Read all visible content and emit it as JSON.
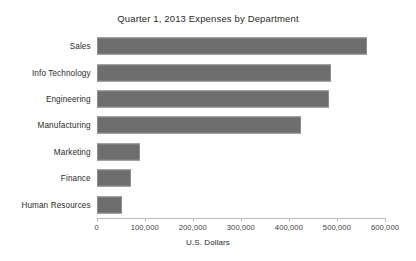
{
  "chart_data": {
    "type": "bar",
    "orientation": "horizontal",
    "title": "Quarter 1, 2013 Expenses by Department",
    "xlabel": "U.S. Dollars",
    "ylabel": "",
    "categories": [
      "Sales",
      "Info Technology",
      "Engineering",
      "Manufacturing",
      "Marketing",
      "Finance",
      "Human Resources"
    ],
    "values": [
      562000,
      488000,
      484000,
      425000,
      90000,
      71000,
      53000
    ],
    "series": [
      {
        "name": "Q1 2013 Expenses",
        "values": [
          562000,
          488000,
          484000,
          425000,
          90000,
          71000,
          53000
        ]
      }
    ],
    "xlim": [
      0,
      600000
    ],
    "xticks": [
      0,
      100000,
      200000,
      300000,
      400000,
      500000,
      600000
    ],
    "xtick_labels": [
      "0",
      "100,000",
      "200,000",
      "300,000",
      "400,000",
      "500,000",
      "600,000"
    ],
    "grid": false,
    "legend": false,
    "bar_color": "#6e6e6e",
    "bar_edge_color": "#8d8d8d",
    "axis_color": "#b9b9b9",
    "background": "#ffffff"
  }
}
